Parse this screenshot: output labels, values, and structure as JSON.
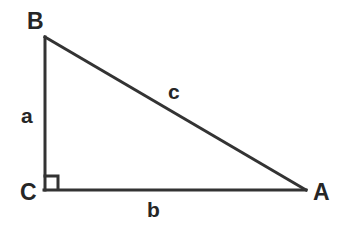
{
  "figure": {
    "type": "geometry-diagram",
    "background_color": "#ffffff",
    "stroke_color": "#333333",
    "label_color": "#262626",
    "vertices": [
      {
        "id": "B",
        "label": "B",
        "x": 44,
        "y": 37,
        "label_x": 27,
        "label_y": 10
      },
      {
        "id": "C",
        "label": "C",
        "x": 44,
        "y": 190,
        "label_x": 20,
        "label_y": 181
      },
      {
        "id": "A",
        "label": "A",
        "x": 305,
        "y": 190,
        "label_x": 313,
        "label_y": 181
      }
    ],
    "sides": [
      {
        "id": "a",
        "label": "a",
        "from": "B",
        "to": "C",
        "name": "vertical-leg",
        "label_x": 21,
        "label_y": 105
      },
      {
        "id": "b",
        "label": "b",
        "from": "C",
        "to": "A",
        "name": "horizontal-leg",
        "label_x": 147,
        "label_y": 199
      },
      {
        "id": "c",
        "label": "c",
        "from": "B",
        "to": "A",
        "name": "hypotenuse",
        "label_x": 168,
        "label_y": 81
      }
    ],
    "right_angle": {
      "at_vertex": "C",
      "marker": "square",
      "size": 14,
      "x": 44,
      "y": 176
    }
  }
}
